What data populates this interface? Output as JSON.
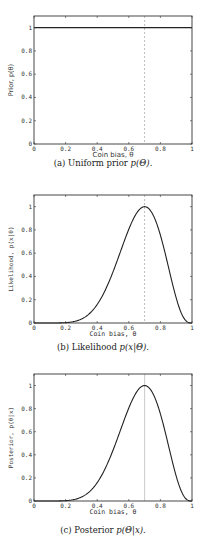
{
  "chart_data": [
    {
      "type": "line",
      "panel": "a",
      "title": "",
      "caption": "(a) Uniform prior p(Θ).",
      "xlabel": "Coin bias, θ",
      "ylabel": "Prior, p(θ)",
      "xlim": [
        0,
        1
      ],
      "ylim": [
        0,
        1.1
      ],
      "xticks": [
        "0",
        "0.2",
        "0.4",
        "0.6",
        "0.8",
        "1"
      ],
      "yticks": [
        "0",
        "0.2",
        "0.4",
        "0.6",
        "0.8",
        "1"
      ],
      "grid": false,
      "series": [
        {
          "name": "prior",
          "x": [
            0,
            1
          ],
          "y": [
            1,
            1
          ]
        }
      ],
      "vline": {
        "x": 0.7,
        "style": "dashed",
        "color": "#aaaaaa"
      }
    },
    {
      "type": "line",
      "panel": "b",
      "title": "",
      "caption": "(b) Likelihood p(x|Θ).",
      "xlabel": "Coin bias, θ",
      "ylabel": "Likelihood, p(x|θ)",
      "xlim": [
        0,
        1
      ],
      "ylim": [
        0,
        1.1
      ],
      "xticks": [
        "0",
        "0.2",
        "0.4",
        "0.6",
        "0.8",
        "1"
      ],
      "yticks": [
        "0",
        "0.2",
        "0.4",
        "0.6",
        "0.8",
        "1"
      ],
      "grid": false,
      "series": [
        {
          "name": "likelihood (normalized, peak at 0.7)",
          "x": [
            0,
            0.1,
            0.2,
            0.3,
            0.4,
            0.5,
            0.6,
            0.7,
            0.8,
            0.9,
            1.0
          ],
          "y": [
            0,
            0.0,
            0.004,
            0.05,
            0.16,
            0.37,
            0.69,
            1.0,
            0.75,
            0.18,
            0
          ]
        }
      ],
      "vline": {
        "x": 0.7,
        "style": "dashed",
        "color": "#aaaaaa"
      }
    },
    {
      "type": "line",
      "panel": "c",
      "title": "",
      "caption": "(c) Posterior p(Θ|x).",
      "xlabel": "Coin bias, θ",
      "ylabel": "Posterior, p(θ|x)",
      "xlim": [
        0,
        1
      ],
      "ylim": [
        0,
        1.1
      ],
      "xticks": [
        "0",
        "0.2",
        "0.4",
        "0.6",
        "0.8",
        "1"
      ],
      "yticks": [
        "0",
        "0.2",
        "0.4",
        "0.6",
        "0.8",
        "1"
      ],
      "grid": false,
      "series": [
        {
          "name": "posterior (normalized, peak at 0.7)",
          "x": [
            0,
            0.1,
            0.2,
            0.3,
            0.4,
            0.5,
            0.6,
            0.7,
            0.8,
            0.9,
            1.0
          ],
          "y": [
            0,
            0.0,
            0.004,
            0.05,
            0.16,
            0.37,
            0.69,
            1.0,
            0.75,
            0.18,
            0
          ]
        }
      ],
      "vline": {
        "x": 0.7,
        "style": "solid",
        "color": "#bbbbbb"
      }
    }
  ],
  "panels": [
    {
      "caption_prefix": "(a) Uniform prior ",
      "caption_math": "p(Θ).",
      "ylabel": "Prior, p(θ)",
      "xlabel": "Coin bias, θ"
    },
    {
      "caption_prefix": "(b) Likelihood ",
      "caption_math": "p(x|Θ).",
      "ylabel": "Likelihood, p(x|θ)",
      "xlabel": "Coin bias, θ"
    },
    {
      "caption_prefix": "(c) Posterior ",
      "caption_math": "p(Θ|x).",
      "ylabel": "Posterior, p(θ|x)",
      "xlabel": "Coin bias, θ"
    }
  ],
  "ticks": {
    "x": [
      "0",
      "0.2",
      "0.4",
      "0.6",
      "0.8",
      "1"
    ],
    "y": [
      "0",
      "0.2",
      "0.4",
      "0.6",
      "0.8",
      "1"
    ]
  }
}
